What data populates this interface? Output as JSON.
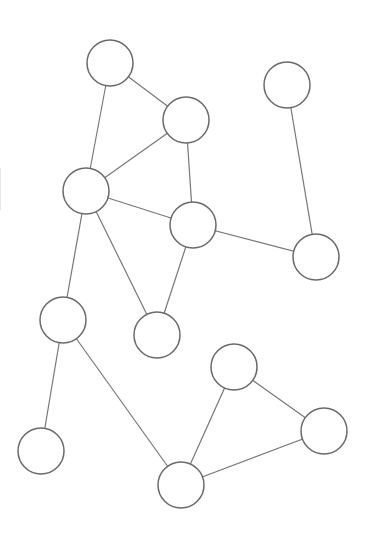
{
  "diagram": {
    "type": "undirected-graph",
    "width": 368,
    "height": 550,
    "background": "#ffffff",
    "node_radius": 23,
    "node_fill": "#ffffff",
    "node_stroke": "#6a6a6a",
    "edge_stroke": "#777777",
    "nodes": [
      {
        "id": "n1",
        "x": 110,
        "y": 63
      },
      {
        "id": "n2",
        "x": 287,
        "y": 85
      },
      {
        "id": "n3",
        "x": 186,
        "y": 120
      },
      {
        "id": "n4",
        "x": 86,
        "y": 191
      },
      {
        "id": "n5",
        "x": 193,
        "y": 225
      },
      {
        "id": "n6",
        "x": 316,
        "y": 257
      },
      {
        "id": "n7",
        "x": 63,
        "y": 320
      },
      {
        "id": "n8",
        "x": 157,
        "y": 335
      },
      {
        "id": "n9",
        "x": 234,
        "y": 367
      },
      {
        "id": "n10",
        "x": 324,
        "y": 431
      },
      {
        "id": "n11",
        "x": 41,
        "y": 451
      },
      {
        "id": "n12",
        "x": 181,
        "y": 485
      }
    ],
    "edges": [
      {
        "from": "n1",
        "to": "n3"
      },
      {
        "from": "n1",
        "to": "n4"
      },
      {
        "from": "n3",
        "to": "n4"
      },
      {
        "from": "n3",
        "to": "n5"
      },
      {
        "from": "n4",
        "to": "n5"
      },
      {
        "from": "n2",
        "to": "n6"
      },
      {
        "from": "n5",
        "to": "n6"
      },
      {
        "from": "n4",
        "to": "n7"
      },
      {
        "from": "n4",
        "to": "n8"
      },
      {
        "from": "n5",
        "to": "n8"
      },
      {
        "from": "n7",
        "to": "n11"
      },
      {
        "from": "n7",
        "to": "n12"
      },
      {
        "from": "n9",
        "to": "n12"
      },
      {
        "from": "n9",
        "to": "n10"
      },
      {
        "from": "n10",
        "to": "n12"
      }
    ]
  }
}
